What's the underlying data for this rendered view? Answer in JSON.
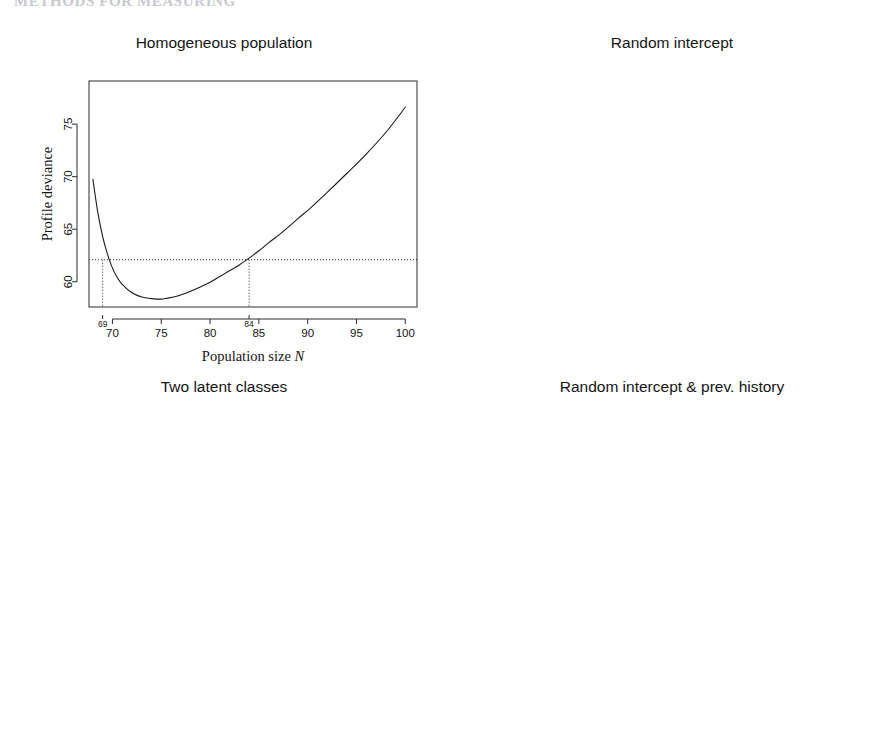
{
  "header": {
    "running_head": "METHODS FOR MEASURING",
    "folio": ""
  },
  "axis_labels": {
    "x_text": "Population size",
    "x_italic": "N",
    "y_text": "Profile deviance"
  },
  "panels": [
    {
      "id": "homogeneous-population",
      "title": "Homogeneous population",
      "y_ticks": [
        60,
        65,
        70,
        75
      ],
      "x_ticks": [
        70,
        75,
        80,
        85,
        90,
        95,
        100
      ],
      "ci_labels": [
        "69",
        "84"
      ],
      "ci": [
        69,
        84
      ],
      "threshold": 62.1,
      "minimum": {
        "x": 75.0,
        "y": 58.35
      }
    },
    {
      "id": "random-intercept",
      "title": "Random intercept",
      "y_ticks": [
        55,
        60,
        65,
        70
      ],
      "x_ticks": [
        80,
        100,
        120,
        140,
        160
      ],
      "ci_labels": [
        "74",
        "153"
      ],
      "ci": [
        74,
        153
      ],
      "threshold": 54.6,
      "minimum": {
        "x": 94.0,
        "y": 52.6
      }
    },
    {
      "id": "two-latent-classes",
      "title": "Two latent classes",
      "y_ticks": [
        48,
        50,
        52,
        54,
        56,
        58,
        60
      ],
      "x_ticks": [
        70,
        80,
        90,
        100
      ],
      "ci_labels": [
        "70",
        "88"
      ],
      "ci": [
        70,
        88
      ],
      "threshold": 51.55,
      "minimum": {
        "x": 77.3,
        "y": 47.75
      }
    },
    {
      "id": "random-intercept-prev-history",
      "title": "Random intercept & prev. history",
      "y_ticks": [
        48,
        49,
        50,
        51,
        52,
        53,
        54
      ],
      "x_ticks": [
        70,
        80,
        90,
        100,
        110,
        120,
        130
      ],
      "ci_labels": [
        "68",
        "116"
      ],
      "ci": [
        68,
        116
      ],
      "threshold": 52.0,
      "minimum": {
        "x": 75.0,
        "y": 48.2
      }
    }
  ],
  "chart_data": [
    {
      "type": "line",
      "title": "Homogeneous population",
      "xlabel": "Population size N",
      "ylabel": "Profile deviance",
      "xlim": [
        67.6,
        101.2
      ],
      "ylim": [
        57.6,
        79.1
      ],
      "xticks": [
        70,
        75,
        80,
        85,
        90,
        95,
        100
      ],
      "yticks": [
        60,
        65,
        70,
        75
      ],
      "grid": false,
      "legend": "none",
      "annotations": {
        "horizontal_reference_line": 62.1,
        "vertical_reference_lines": [
          69,
          84
        ],
        "vertical_line_labels": [
          "69",
          "84"
        ]
      },
      "series": [
        {
          "name": "profile deviance",
          "x": [
            68.0,
            68.5,
            69.0,
            69.5,
            70.0,
            70.5,
            71.0,
            72.0,
            73.0,
            74.0,
            75.0,
            76.0,
            77.0,
            78.0,
            79.0,
            80.0,
            81.0,
            82.0,
            83.0,
            84.0,
            85.0,
            86.0,
            87.5,
            89.0,
            90.5,
            92.0,
            94.0,
            96.0,
            98.0,
            100.0
          ],
          "y": [
            69.75,
            66.6,
            64.3,
            62.6,
            61.3,
            60.4,
            59.75,
            58.95,
            58.55,
            58.4,
            58.35,
            58.5,
            58.75,
            59.1,
            59.5,
            59.95,
            60.5,
            61.05,
            61.6,
            62.25,
            62.95,
            63.7,
            64.8,
            66.0,
            67.2,
            68.5,
            70.3,
            72.15,
            74.2,
            76.6
          ]
        }
      ]
    },
    {
      "type": "line",
      "title": "Random intercept",
      "xlabel": "Population size N",
      "ylabel": "Profile deviance",
      "xlim": [
        70.0,
        164.0
      ],
      "ylim": [
        51.6,
        70.3
      ],
      "xticks": [
        80,
        100,
        120,
        140,
        160
      ],
      "yticks": [
        55,
        60,
        65,
        70
      ],
      "grid": false,
      "legend": "none",
      "annotations": {
        "horizontal_reference_line": 54.6,
        "vertical_reference_lines": [
          74,
          153
        ],
        "vertical_line_labels": [
          "74",
          "153"
        ]
      },
      "series": [
        {
          "name": "profile deviance",
          "x": [
            72.0,
            72.5,
            73.0,
            74.0,
            75.0,
            76.0,
            77.0,
            78.0,
            79.0,
            80.0,
            82.0,
            84.0,
            86.0,
            88.0,
            91.0,
            94.0,
            97.0,
            100.0,
            105.0,
            110.0,
            115.0,
            120.0,
            125.0,
            130.0,
            135.0,
            140.0,
            145.0,
            150.0,
            155.0,
            160.0,
            162.0
          ],
          "y": [
            69.4,
            66.3,
            63.8,
            60.3,
            58.0,
            56.45,
            55.4,
            54.6,
            54.05,
            53.65,
            53.1,
            52.8,
            52.65,
            52.58,
            52.55,
            52.6,
            52.7,
            52.82,
            53.05,
            53.28,
            53.48,
            53.66,
            53.82,
            53.96,
            54.1,
            54.22,
            54.36,
            54.5,
            54.66,
            54.84,
            54.92
          ]
        }
      ]
    },
    {
      "type": "line",
      "title": "Two latent classes",
      "xlabel": "Population size N",
      "ylabel": "Profile deviance",
      "xlim": [
        67.3,
        103.3
      ],
      "ylim": [
        47.3,
        61.6
      ],
      "xticks": [
        70,
        80,
        90,
        100
      ],
      "yticks": [
        48,
        50,
        52,
        54,
        56,
        58,
        60
      ],
      "grid": false,
      "legend": "none",
      "annotations": {
        "horizontal_reference_line": 51.55,
        "vertical_reference_lines": [
          70,
          88
        ],
        "vertical_line_labels": [
          "70",
          "88"
        ]
      },
      "series": [
        {
          "name": "profile deviance",
          "x": [
            68.0,
            68.5,
            69.0,
            69.5,
            70.0,
            70.5,
            71.0,
            72.0,
            73.0,
            74.0,
            75.0,
            76.0,
            77.0,
            78.0,
            79.0,
            80.0,
            81.0,
            82.0,
            83.0,
            84.0,
            85.0,
            86.0,
            87.0,
            88.0,
            89.0,
            90.0,
            91.0,
            92.5,
            94.0,
            96.0,
            98.0,
            100.0,
            102.0
          ],
          "y": [
            61.25,
            59.4,
            57.85,
            56.5,
            55.3,
            54.25,
            53.35,
            51.95,
            50.85,
            49.9,
            49.1,
            48.4,
            47.9,
            47.75,
            47.85,
            48.2,
            48.7,
            49.3,
            49.95,
            50.6,
            51.15,
            51.65,
            52.05,
            52.4,
            52.75,
            53.1,
            53.4,
            53.72,
            53.95,
            54.2,
            54.35,
            54.45,
            54.5
          ]
        }
      ]
    },
    {
      "type": "line",
      "title": "Random intercept & prev. history",
      "xlabel": "Population size N",
      "ylabel": "Profile deviance",
      "xlim": [
        65.2,
        132.5
      ],
      "ylim": [
        47.72,
        54.85
      ],
      "xticks": [
        70,
        80,
        90,
        100,
        110,
        120,
        130
      ],
      "yticks": [
        48,
        49,
        50,
        51,
        52,
        53,
        54
      ],
      "grid": false,
      "legend": "none",
      "annotations": {
        "horizontal_reference_line": 52.0,
        "vertical_reference_lines": [
          68,
          116
        ],
        "vertical_line_labels": [
          "68",
          "116"
        ]
      },
      "series": [
        {
          "name": "profile deviance",
          "x": [
            68.0,
            68.3,
            68.7,
            69.2,
            69.8,
            70.5,
            71.2,
            72.0,
            73.0,
            74.0,
            75.0,
            76.0,
            77.0,
            78.0,
            80.0,
            82.0,
            85.0,
            88.0,
            91.0,
            94.0,
            97.0,
            100.0,
            104.0,
            108.0,
            112.0,
            116.0,
            120.0,
            124.0,
            127.0,
            130.0
          ],
          "y": [
            54.65,
            53.3,
            51.7,
            50.3,
            49.4,
            48.8,
            48.45,
            48.28,
            48.2,
            48.18,
            48.2,
            48.3,
            48.42,
            48.58,
            48.95,
            49.3,
            49.8,
            50.25,
            50.62,
            50.95,
            51.22,
            51.45,
            51.7,
            51.9,
            52.05,
            52.2,
            52.4,
            52.6,
            52.75,
            52.9
          ]
        }
      ]
    }
  ]
}
